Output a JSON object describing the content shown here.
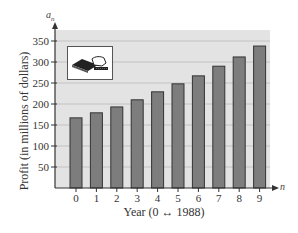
{
  "chart_data": {
    "type": "bar",
    "title": "",
    "xlabel": "Year (0 ↔ 1988)",
    "ylabel": "Profit (in millions of dollars)",
    "y_axis_symbol": "a",
    "y_axis_symbol_sub": "n",
    "x_axis_symbol": "n",
    "categories": [
      "0",
      "1",
      "2",
      "3",
      "4",
      "5",
      "6",
      "7",
      "8",
      "9"
    ],
    "values": [
      167,
      179,
      193,
      210,
      229,
      248,
      267,
      290,
      312,
      338
    ],
    "yticks": [
      50,
      100,
      150,
      200,
      250,
      300,
      350
    ],
    "ylim": [
      0,
      375
    ],
    "grid": true,
    "legend": null,
    "inset_icon": "hand-inserting-card-icon"
  },
  "colors": {
    "plot_bg": "#e3e3e3",
    "bar_fill": "#7d7d7d",
    "bar_edge": "#333333",
    "grid": "#c2c2c2",
    "axis": "#333333"
  }
}
